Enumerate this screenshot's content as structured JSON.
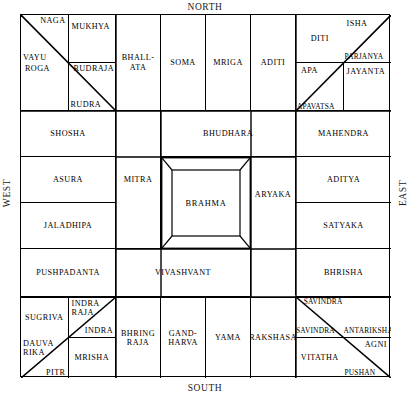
{
  "directions": {
    "north": "NORTH",
    "south": "SOUTH",
    "east": "EAST",
    "west": "WEST"
  },
  "colors": {
    "line": "#000000",
    "background": "#ffffff",
    "text": "#000000"
  },
  "center": {
    "label": "BRAHMA"
  },
  "corners": {
    "northwest": {
      "cells": [
        "NAGA",
        "MUKHYA",
        "VAYU",
        "ROGA",
        "RUDRAJA",
        "RUDRA"
      ],
      "naga": "NAGA",
      "mukhya": "MUKHYA",
      "vayu": "VAYU",
      "roga": "ROGA",
      "rudraja": "RUDRAJA",
      "rudra": "RUDRA"
    },
    "northeast": {
      "cells": [
        "DITI",
        "ISHA",
        "PARJANYA",
        "APA",
        "JAYANTA",
        "APAVATSA"
      ],
      "diti": "DITI",
      "isha": "ISHA",
      "parjanya": "PARJANYA",
      "apa": "APA",
      "jayanta": "JAYANTA",
      "apavatsa": "APAVATSA"
    },
    "southwest": {
      "cells": [
        "SUGRIVA",
        "INDRA RAJA",
        "INDRA",
        "DAUVA RIKA",
        "MRISHA",
        "PITR"
      ],
      "sugriva": "SUGRIVA",
      "indra_raja_1": "INDRA",
      "indra_raja_2": "RAJA",
      "indra": "INDRA",
      "dauva_1": "DAUVA",
      "dauva_2": "RIKA",
      "mrisha": "MRISHA",
      "pitr": "PITR"
    },
    "southeast": {
      "cells": [
        "SAVINDRA",
        "SAVINDRA",
        "ANTARIKSHA",
        "VITATHA",
        "AGNI",
        "PUSHAN"
      ],
      "savindra_top": "SAVINDRA",
      "savindra_mid": "SAVINDRA",
      "antariksha": "ANTARIKSHA",
      "vitatha": "VITATHA",
      "agni": "AGNI",
      "pushan": "PUSHAN"
    }
  },
  "edges": {
    "north_row": [
      {
        "label": "BHALL-\nATA",
        "line1": "BHALL-",
        "line2": "ATA"
      },
      {
        "label": "SOMA",
        "line1": "SOMA",
        "line2": ""
      },
      {
        "label": "MRIGA",
        "line1": "MRIGA",
        "line2": ""
      },
      {
        "label": "ADITI",
        "line1": "ADITI",
        "line2": ""
      }
    ],
    "south_row": [
      {
        "label": "BHRING RAJA",
        "line1": "BHRING",
        "line2": "RAJA"
      },
      {
        "label": "GAND-HARVA",
        "line1": "GAND-",
        "line2": "HARVA"
      },
      {
        "label": "YAMA",
        "line1": "YAMA",
        "line2": ""
      },
      {
        "label": "RAKSHASA",
        "line1": "RAKSHASA",
        "line2": ""
      }
    ],
    "west_column": [
      {
        "label": "SHOSHA"
      },
      {
        "label": "ASURA"
      },
      {
        "label": "JALADHIPA"
      },
      {
        "label": "PUSHPADANTA"
      }
    ],
    "east_column": [
      {
        "label": "MAHENDRA"
      },
      {
        "label": "ADITYA"
      },
      {
        "label": "SATYAKA"
      },
      {
        "label": "BHRISHA"
      }
    ]
  },
  "inner_ring": {
    "north": "BHUDHARA",
    "south": "VIVASHVANT",
    "west": "MITRA",
    "east": "ARYAKA"
  }
}
